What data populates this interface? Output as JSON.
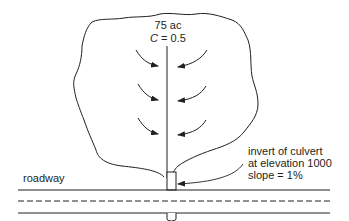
{
  "diagram": {
    "watershed": {
      "area_label": "75 ac",
      "coef_symbol": "C",
      "coef_eq": " = 0.5"
    },
    "culvert_note": {
      "line1": "invert of culvert",
      "line2": "at elevation 1000",
      "line3": "slope = 1%"
    },
    "roadway_label": "roadway",
    "colors": {
      "ink": "#231f20",
      "background": "#ffffff"
    }
  }
}
